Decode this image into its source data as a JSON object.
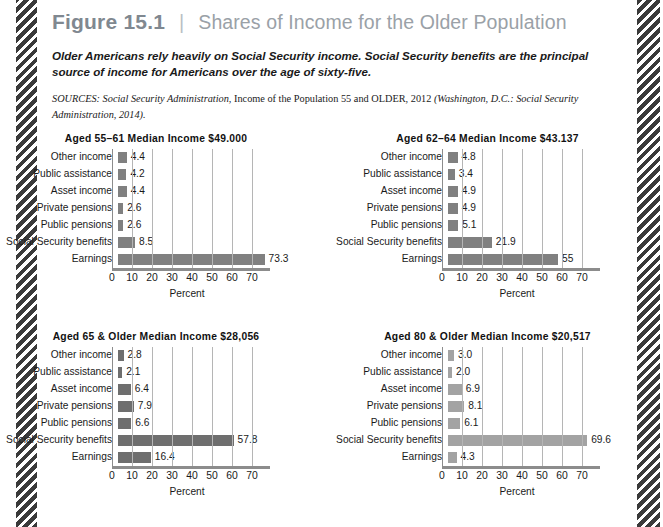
{
  "figure": {
    "number": "Figure 15.1",
    "divider": "|",
    "title": "Shares of Income for the Older Population",
    "caption": "Older Americans rely heavily on Social Security income. Social Security benefits are the principal source of income for Americans over the age of sixty-five.",
    "sources_label": "SOURCES:",
    "sources_part1": " Social Security Administration,",
    "sources_part2": " Income of the Population 55 and OLDER, 2012",
    "sources_part3": " (Washington, D.C.: Social Security Administration, 2014).",
    "accent_number_color": "#808890",
    "accent_title_color": "#9aa1a7",
    "bar_color_dark": "#808080",
    "bar_color_light": "#a3a3a3"
  },
  "chart_data": [
    {
      "type": "bar",
      "orientation": "horizontal",
      "title": "Aged 55–61 Median Income $49.000",
      "xlabel": "Percent",
      "ylabel": "",
      "xlim": [
        0,
        75
      ],
      "xticks": [
        0,
        10,
        20,
        30,
        40,
        50,
        60,
        70
      ],
      "grid": true,
      "legend": "none",
      "bar_color": "#808080",
      "categories": [
        "Other income",
        "Public assistance",
        "Asset income",
        "Private pensions",
        "Public pensions",
        "Social Security benefits",
        "Earnings"
      ],
      "values": [
        4.4,
        4.2,
        4.4,
        2.6,
        2.6,
        8.5,
        73.3
      ],
      "value_labels": [
        "4.4",
        "4.2",
        "4.4",
        "2.6",
        "2.6",
        "8.5",
        "73.3"
      ]
    },
    {
      "type": "bar",
      "orientation": "horizontal",
      "title": "Aged 62–64 Median Income $43.137",
      "xlabel": "Percent",
      "ylabel": "",
      "xlim": [
        0,
        75
      ],
      "xticks": [
        0,
        10,
        20,
        30,
        40,
        50,
        60,
        70
      ],
      "grid": true,
      "legend": "none",
      "bar_color": "#808080",
      "categories": [
        "Other income",
        "Public assistance",
        "Asset income",
        "Private pensions",
        "Public pensions",
        "Social Security benefits",
        "Earnings"
      ],
      "values": [
        4.8,
        3.4,
        4.9,
        4.9,
        5.1,
        21.9,
        55
      ],
      "value_labels": [
        "4.8",
        "3.4",
        "4.9",
        "4.9",
        "5.1",
        "21.9",
        "55"
      ]
    },
    {
      "type": "bar",
      "orientation": "horizontal",
      "title": "Aged 65 & Older Median Income $28,056",
      "xlabel": "Percent",
      "ylabel": "",
      "xlim": [
        0,
        75
      ],
      "xticks": [
        0,
        10,
        20,
        30,
        40,
        50,
        60,
        70
      ],
      "grid": true,
      "legend": "none",
      "bar_color": "#6e6e6e",
      "categories": [
        "Other income",
        "Public assistance",
        "Asset income",
        "Private pensions",
        "Public pensions",
        "Social Security benefits",
        "Earnings"
      ],
      "values": [
        2.8,
        2.1,
        6.4,
        7.9,
        6.6,
        57.8,
        16.4
      ],
      "value_labels": [
        "2.8",
        "2.1",
        "6.4",
        "7.9",
        "6.6",
        "57.8",
        "16.4"
      ]
    },
    {
      "type": "bar",
      "orientation": "horizontal",
      "title": "Aged 80 & Older Median Income $20,517",
      "xlabel": "Percent",
      "ylabel": "",
      "xlim": [
        0,
        75
      ],
      "xticks": [
        0,
        10,
        20,
        30,
        40,
        50,
        60,
        70
      ],
      "grid": true,
      "legend": "none",
      "bar_color": "#a3a3a3",
      "categories": [
        "Other income",
        "Public assistance",
        "Asset income",
        "Private pensions",
        "Public pensions",
        "Social Security benefits",
        "Earnings"
      ],
      "values": [
        3.0,
        2.0,
        6.9,
        8.1,
        6.1,
        69.6,
        4.3
      ],
      "value_labels": [
        "3.0",
        "2.0",
        "6.9",
        "8.1",
        "6.1",
        "69.6",
        "4.3"
      ]
    }
  ]
}
